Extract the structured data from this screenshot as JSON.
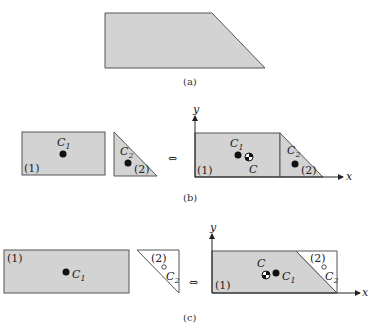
{
  "figure": {
    "colors": {
      "fill": "#d3d3d3",
      "stroke": "#555555",
      "dot": "#111111",
      "background": "#ffffff"
    },
    "panel_a": {
      "caption": "(a)"
    },
    "panel_b": {
      "caption": "(b)",
      "equivalence_symbol": "⇔",
      "left": {
        "part1_label": "(1)",
        "part2_label": "(2)",
        "c1_label": "C",
        "c1_sub": "1",
        "c2_label": "C",
        "c2_sub": "2"
      },
      "right": {
        "axis_x": "x",
        "axis_y": "y",
        "part1_label": "(1)",
        "part2_label": "(2)",
        "c1_label": "C",
        "c1_sub": "1",
        "c_label": "C",
        "c2_label": "C",
        "c2_sub": "2"
      }
    },
    "panel_c": {
      "caption": "(c)",
      "equivalence_symbol": "⇔",
      "left": {
        "part1_label": "(1)",
        "part2_label": "(2)",
        "c1_label": "C",
        "c1_sub": "1",
        "c2_label": "C",
        "c2_sub": "2"
      },
      "right": {
        "axis_x": "x",
        "axis_y": "y",
        "part1_label": "(1)",
        "part2_label": "(2)",
        "c_label": "C",
        "c1_label": "C",
        "c1_sub": "1",
        "c2_label": "C",
        "c2_sub": "2"
      }
    }
  }
}
